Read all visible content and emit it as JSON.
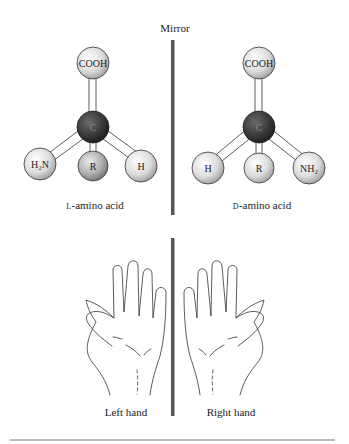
{
  "title": "Mirror",
  "molecules": [
    {
      "name": "L-amino acid",
      "prefix": "L",
      "suffix": "-amino acid",
      "top": "COOH",
      "center": "C",
      "left": "H₂N",
      "middle": "R",
      "right": "H"
    },
    {
      "name": "D-amino acid",
      "prefix": "D",
      "suffix": "-amino acid",
      "top": "COOH",
      "center": "C",
      "left": "H",
      "middle": "R",
      "right": "NH₂"
    }
  ],
  "hands": [
    {
      "label": "Left hand"
    },
    {
      "label": "Right hand"
    }
  ],
  "colors": {
    "mirror": "#555555",
    "carbon": "#3a3a3a",
    "light_ball": "#e6e6e6",
    "r_ball": "#b8b8b8",
    "outline": "#333333"
  }
}
